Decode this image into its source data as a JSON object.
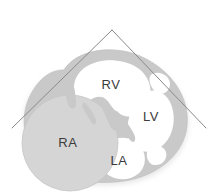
{
  "figure": {
    "width": 219,
    "height": 194,
    "background_color": "#ffffff"
  },
  "colors": {
    "myocardium_wall": "#c9c9c9",
    "wall_shadow": "#bdbdbd",
    "chamber_lumen": "#ffffff",
    "right_atrium_fill": "#d5d5d5",
    "sector_line": "#8a8a8a",
    "label_text": "#3b3b3b",
    "outline": "#c2c2c2"
  },
  "labels": [
    {
      "id": "rv",
      "text": "RV",
      "name": "right-ventricle",
      "x": 111,
      "y": 86
    },
    {
      "id": "lv",
      "text": "LV",
      "name": "left-ventricle",
      "x": 151,
      "y": 118
    },
    {
      "id": "ra",
      "text": "RA",
      "name": "right-atrium",
      "x": 68,
      "y": 144
    },
    {
      "id": "la",
      "text": "LA",
      "name": "left-atrium",
      "x": 119,
      "y": 162
    }
  ],
  "sector_overlay": {
    "name": "ultrasound-sector",
    "apex": {
      "x": 112,
      "y": 30
    },
    "left_endpoint": {
      "x": 12,
      "y": 128
    },
    "right_endpoint": {
      "x": 206,
      "y": 128
    },
    "stroke_width": 1
  }
}
